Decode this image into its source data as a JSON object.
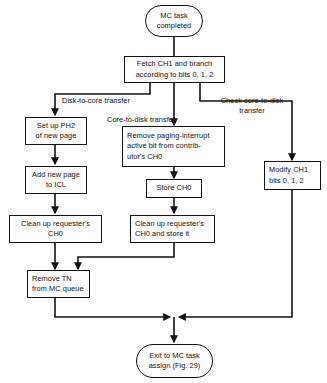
{
  "figure": {
    "type": "flowchart",
    "orientation": "top-to-bottom",
    "line_color": "#111111",
    "background_color": "#ffffff"
  },
  "nodes": {
    "start": {
      "shape": "terminal",
      "text": "MC task\ncompleted"
    },
    "fetch": {
      "shape": "process",
      "text": "Fetch CH1 and branch\naccording to bits 0, 1, 2"
    },
    "set_up_ph2": {
      "shape": "process",
      "text": "Set up PH2\nof new page"
    },
    "add_new_page": {
      "shape": "process",
      "text": "Add new page\nto ICL"
    },
    "clean_up_left": {
      "shape": "process",
      "text": "Clean up requester's\nCH0"
    },
    "remove_paging": {
      "shape": "process",
      "text": "Remove paging-interrupt\nactive bit from contrib-\nutor's CH0"
    },
    "store_ch0": {
      "shape": "process",
      "text": "Store CH0"
    },
    "clean_up_middle": {
      "shape": "process",
      "text": "Clean up requester's\nCH0 and store it"
    },
    "modify_ch1": {
      "shape": "process",
      "text": "Modify CH1\nbits 0, 1, 2"
    },
    "remove_tn": {
      "shape": "process",
      "text": "Remove TN\nfrom MC queue"
    },
    "exit": {
      "shape": "terminal",
      "text": "Exit to MC task\nassign (Fig. 29)"
    }
  },
  "edge_labels": {
    "disk_to_core": "Disk-to-core transfer",
    "core_to_disk": "Core-to-disk  transfer",
    "check_core_to_disk": "Check core-to-disk\ntransfer"
  }
}
